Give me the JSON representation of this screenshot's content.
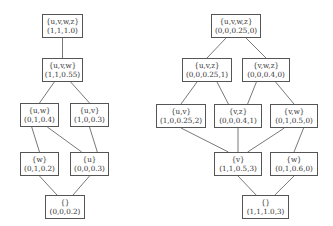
{
  "diagrams": [
    {
      "id": "left",
      "nodes": [
        {
          "id": "L_uvwz",
          "set": "{u,v,w,z}",
          "tuple": "(1,1,1.0)"
        },
        {
          "id": "L_uvw",
          "set": "{u,v,w}",
          "tuple": "(1,1,0.55)"
        },
        {
          "id": "L_uw",
          "set": "{u,w}",
          "tuple": "(0,1,0.4)"
        },
        {
          "id": "L_uv",
          "set": "{u,v}",
          "tuple": "(1,0,0.3)"
        },
        {
          "id": "L_w",
          "set": "{w}",
          "tuple": "(0,1,0.2)"
        },
        {
          "id": "L_u",
          "set": "{u}",
          "tuple": "(0,0,0.3)"
        },
        {
          "id": "L_empty",
          "set": "{}",
          "tuple": "(0,0,0.2)"
        }
      ],
      "edges": [
        [
          "L_uvwz",
          "L_uvw"
        ],
        [
          "L_uvw",
          "L_uw"
        ],
        [
          "L_uvw",
          "L_uv"
        ],
        [
          "L_uw",
          "L_w"
        ],
        [
          "L_uw",
          "L_u"
        ],
        [
          "L_uv",
          "L_u"
        ],
        [
          "L_w",
          "L_empty"
        ],
        [
          "L_u",
          "L_empty"
        ]
      ]
    },
    {
      "id": "right",
      "nodes": [
        {
          "id": "R_uvwz",
          "set": "{u,v,w,z}",
          "tuple": "(0,0,0.25,0)"
        },
        {
          "id": "R_uvz",
          "set": "{u,v,z}",
          "tuple": "(0,0,0.25,1)"
        },
        {
          "id": "R_vwz",
          "set": "{v,w,z}",
          "tuple": "(0,0,0.4,0)"
        },
        {
          "id": "R_uv",
          "set": "{u,v}",
          "tuple": "(1,0,0.25,2)"
        },
        {
          "id": "R_vz",
          "set": "{v,z}",
          "tuple": "(0,0,0.4,1)"
        },
        {
          "id": "R_vw",
          "set": "{v,w}",
          "tuple": "(0,1,0.5,0)"
        },
        {
          "id": "R_v",
          "set": "{v}",
          "tuple": "(1,1,0.5,3)"
        },
        {
          "id": "R_w",
          "set": "{w}",
          "tuple": "(0,1,0.6,0)"
        },
        {
          "id": "R_empty",
          "set": "{}",
          "tuple": "(1,1,1.0,3)"
        }
      ],
      "edges": [
        [
          "R_uvwz",
          "R_uvz"
        ],
        [
          "R_uvwz",
          "R_vwz"
        ],
        [
          "R_uvz",
          "R_uv"
        ],
        [
          "R_uvz",
          "R_vz"
        ],
        [
          "R_vwz",
          "R_vz"
        ],
        [
          "R_vwz",
          "R_vw"
        ],
        [
          "R_uv",
          "R_v"
        ],
        [
          "R_vz",
          "R_v"
        ],
        [
          "R_vw",
          "R_v"
        ],
        [
          "R_vw",
          "R_w"
        ],
        [
          "R_v",
          "R_empty"
        ],
        [
          "R_w",
          "R_empty"
        ]
      ]
    }
  ]
}
